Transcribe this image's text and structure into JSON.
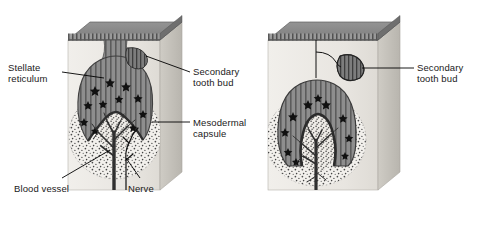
{
  "figure": {
    "background_color": "#ffffff",
    "width": 480,
    "height": 230
  },
  "palette": {
    "block_front_face": "#ebe9e4",
    "block_side_face": "#c9c6bf",
    "block_top_face": "#8b8b8b",
    "block_top_edge": "#6e6e6e",
    "enamel_organ_fill": "#8a8a8a",
    "enamel_organ_dark": "#5f5f5f",
    "stellate_fill": "#a3a3a3",
    "tooth_bud_fill": "#6b6b6b",
    "capsule_stipple": "#4a4a4a",
    "vessel_color": "#3a3a3a",
    "nerve_color": "#1a1a1a",
    "leader_line": "#000000",
    "text_color": "#1a1a1a"
  },
  "labels": {
    "stellate_reticulum": {
      "text": "Stellate\nreticulum",
      "x": 8,
      "y": 62,
      "align": "left"
    },
    "secondary_tooth_bud_left": {
      "text": "Secondary\ntooth bud",
      "x": 193,
      "y": 66,
      "align": "left"
    },
    "mesodermal_capsule": {
      "text": "Mesodermal\ncapsule",
      "x": 193,
      "y": 117,
      "align": "left"
    },
    "blood_vessel": {
      "text": "Blood vessel",
      "x": 14,
      "y": 183,
      "align": "left"
    },
    "nerve": {
      "text": "Nerve",
      "x": 128,
      "y": 183,
      "align": "left"
    },
    "secondary_tooth_bud_right": {
      "text": "Secondary\ntooth bud",
      "x": 417,
      "y": 62,
      "align": "left"
    }
  },
  "panels": [
    {
      "name": "left-panel",
      "stage": "early bell stage with secondary tooth bud forming from dental lamina",
      "block": {
        "front_x": 68,
        "front_y": 40,
        "front_w": 92,
        "front_h": 150,
        "depth_x": 22,
        "depth_y": -18
      },
      "structures": [
        "oral epithelium",
        "dental lamina",
        "enamel organ",
        "stellate reticulum",
        "inner enamel epithelium",
        "dental papilla",
        "mesodermal capsule",
        "blood vessel",
        "nerve",
        "secondary tooth bud"
      ]
    },
    {
      "name": "right-panel",
      "stage": "late bell stage, secondary tooth bud separated from enamel organ",
      "block": {
        "front_x": 268,
        "front_y": 40,
        "front_w": 110,
        "front_h": 150,
        "depth_x": 22,
        "depth_y": -18
      },
      "structures": [
        "oral epithelium",
        "dental lamina remnant",
        "enamel organ",
        "stellate reticulum",
        "dental papilla",
        "mesodermal capsule",
        "blood vessel",
        "secondary tooth bud"
      ]
    }
  ]
}
